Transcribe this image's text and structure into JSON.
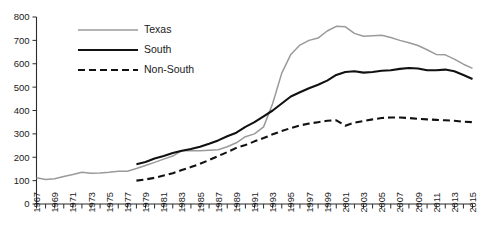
{
  "chart_data": {
    "type": "line",
    "title": "",
    "xlabel": "",
    "ylabel": "",
    "xlim": [
      1967,
      2015
    ],
    "ylim": [
      0,
      800
    ],
    "grid": false,
    "legend_position": "top-left",
    "y_ticks": [
      0,
      100,
      200,
      300,
      400,
      500,
      600,
      700,
      800
    ],
    "x_ticks": [
      1967,
      1969,
      1971,
      1973,
      1975,
      1977,
      1979,
      1981,
      1983,
      1985,
      1987,
      1989,
      1991,
      1993,
      1995,
      1997,
      1999,
      2001,
      2003,
      2005,
      2007,
      2009,
      2011,
      2013,
      2015
    ],
    "x_all_years": [
      1967,
      1968,
      1969,
      1970,
      1971,
      1972,
      1973,
      1974,
      1975,
      1976,
      1977,
      1978,
      1979,
      1980,
      1981,
      1982,
      1983,
      1984,
      1985,
      1986,
      1987,
      1988,
      1989,
      1990,
      1991,
      1992,
      1993,
      1994,
      1995,
      1996,
      1997,
      1998,
      1999,
      2000,
      2001,
      2002,
      2003,
      2004,
      2005,
      2006,
      2007,
      2008,
      2009,
      2010,
      2011,
      2012,
      2013,
      2014,
      2015
    ],
    "series": [
      {
        "name": "Texas",
        "color": "#9a9a9a",
        "style": "solid",
        "width": 1.5,
        "x": [
          1967,
          1968,
          1969,
          1970,
          1971,
          1972,
          1973,
          1974,
          1975,
          1976,
          1977,
          1978,
          1979,
          1980,
          1981,
          1982,
          1983,
          1984,
          1985,
          1986,
          1987,
          1988,
          1989,
          1990,
          1991,
          1992,
          1993,
          1994,
          1995,
          1996,
          1997,
          1998,
          1999,
          2000,
          2001,
          2002,
          2003,
          2004,
          2005,
          2006,
          2007,
          2008,
          2009,
          2010,
          2011,
          2012,
          2013,
          2014,
          2015
        ],
        "values": [
          112,
          105,
          108,
          118,
          126,
          136,
          132,
          133,
          136,
          140,
          140,
          152,
          165,
          178,
          192,
          205,
          228,
          228,
          228,
          230,
          232,
          245,
          262,
          288,
          300,
          330,
          430,
          560,
          640,
          680,
          700,
          710,
          740,
          760,
          758,
          730,
          718,
          720,
          722,
          712,
          700,
          690,
          678,
          660,
          640,
          638,
          620,
          598,
          580
        ]
      },
      {
        "name": "South",
        "color": "#111111",
        "style": "solid",
        "width": 2.1,
        "x": [
          1978,
          1979,
          1980,
          1981,
          1982,
          1983,
          1984,
          1985,
          1986,
          1987,
          1988,
          1989,
          1990,
          1991,
          1992,
          1993,
          1994,
          1995,
          1996,
          1997,
          1998,
          1999,
          2000,
          2001,
          2002,
          2003,
          2004,
          2005,
          2006,
          2007,
          2008,
          2009,
          2010,
          2011,
          2012,
          2013,
          2014,
          2015
        ],
        "values": [
          170,
          180,
          195,
          205,
          218,
          228,
          235,
          245,
          258,
          272,
          290,
          305,
          330,
          350,
          375,
          400,
          430,
          460,
          478,
          495,
          510,
          528,
          552,
          565,
          568,
          562,
          565,
          570,
          572,
          578,
          582,
          580,
          572,
          572,
          575,
          568,
          552,
          535
        ]
      },
      {
        "name": "Non-South",
        "color": "#111111",
        "style": "dashed",
        "width": 2.1,
        "x": [
          1978,
          1979,
          1980,
          1981,
          1982,
          1983,
          1984,
          1985,
          1986,
          1987,
          1988,
          1989,
          1990,
          1991,
          1992,
          1993,
          1994,
          1995,
          1996,
          1997,
          1998,
          1999,
          2000,
          2001,
          2002,
          2003,
          2004,
          2005,
          2006,
          2007,
          2008,
          2009,
          2010,
          2011,
          2012,
          2013,
          2014,
          2015
        ],
        "values": [
          100,
          105,
          112,
          122,
          132,
          145,
          158,
          172,
          188,
          205,
          222,
          240,
          252,
          268,
          282,
          298,
          312,
          325,
          336,
          344,
          350,
          356,
          358,
          335,
          348,
          355,
          362,
          368,
          370,
          370,
          368,
          364,
          362,
          360,
          358,
          356,
          352,
          350
        ]
      }
    ]
  },
  "legend": {
    "items": [
      {
        "label": "Texas"
      },
      {
        "label": "South"
      },
      {
        "label": "Non-South"
      }
    ]
  }
}
